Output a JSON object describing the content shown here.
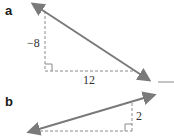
{
  "parts": [
    {
      "label": "a",
      "rise_label": "−8",
      "run_label": "12",
      "line_color": "#7a7a7a",
      "dash_color": "#8a8a8a"
    },
    {
      "label": "b",
      "rise_label": "2",
      "line_color": "#7a7a7a",
      "dash_color": "#8a8a8a"
    }
  ]
}
